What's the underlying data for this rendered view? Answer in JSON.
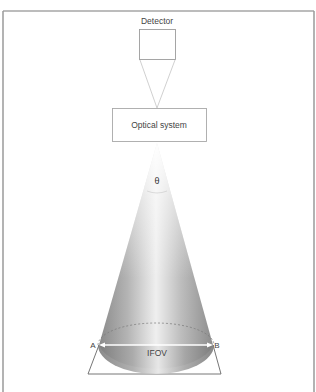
{
  "diagram": {
    "detector": {
      "label": "Detector"
    },
    "optical_system": {
      "label": "Optical system"
    },
    "cone": {
      "angle_label": "θ"
    },
    "footprint": {
      "label": "IFOV",
      "left_point": "A",
      "right_point": "B"
    }
  },
  "colors": {
    "frame": "#9a9a9a",
    "lines": "#b8b8b8",
    "text": "#333333",
    "cone_dark": "#8e8e8e",
    "cone_light": "#f2f2f2"
  }
}
